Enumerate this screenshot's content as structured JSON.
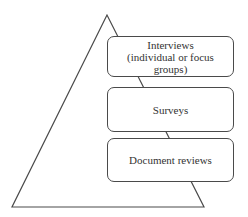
{
  "diagram": {
    "type": "pyramid",
    "triangle": {
      "apex": [
        107,
        15
      ],
      "bottom_left": [
        12,
        207
      ],
      "bottom_right": [
        204,
        207
      ],
      "stroke": "#4a4a4a"
    },
    "levels": [
      {
        "label": "Interviews\n(individual or focus\ngroups)",
        "box": {
          "x": 107,
          "y": 36,
          "w": 127,
          "h": 41
        }
      },
      {
        "label": "Surveys",
        "box": {
          "x": 107,
          "y": 87,
          "w": 127,
          "h": 45
        }
      },
      {
        "label": "Document reviews",
        "box": {
          "x": 107,
          "y": 138,
          "w": 127,
          "h": 44
        }
      }
    ]
  }
}
